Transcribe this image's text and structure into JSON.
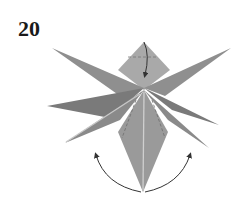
{
  "diagram": {
    "step_number": "20",
    "colors": {
      "paper_light": "#a9a9a9",
      "paper_mid": "#8f8f8f",
      "paper_dark": "#7a7a7a",
      "crease_highlight": "#c8c8c8",
      "arrow": "#333333",
      "background": "#ffffff"
    },
    "elements": [
      "top-diamond-flap (fold down arrow)",
      "star points: upper-left, upper-right, mid-left, mid-right, lower-left, lower-right, bottom",
      "dashed fold lines",
      "two curved arrows at bottom indicating spreading/rotation"
    ]
  }
}
